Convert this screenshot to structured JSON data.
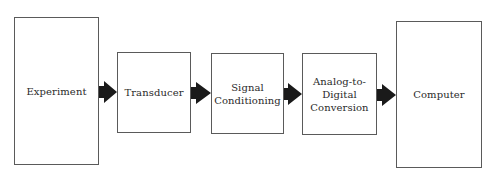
{
  "diagram": {
    "type": "block-flow",
    "direction": "left-to-right",
    "nodes": [
      {
        "id": "experiment",
        "label": "Experiment"
      },
      {
        "id": "transducer",
        "label": "Transducer"
      },
      {
        "id": "signal-conditioning",
        "label": "Signal\nConditioning"
      },
      {
        "id": "adc",
        "label": "Analog-to-\nDigital\nConversion"
      },
      {
        "id": "computer",
        "label": "Computer"
      }
    ],
    "edges": [
      {
        "from": "experiment",
        "to": "transducer"
      },
      {
        "from": "transducer",
        "to": "signal-conditioning"
      },
      {
        "from": "signal-conditioning",
        "to": "adc"
      },
      {
        "from": "adc",
        "to": "computer"
      }
    ],
    "colors": {
      "border": "#5a5a5a",
      "arrow": "#1a1a1a",
      "background": "#ffffff"
    }
  }
}
